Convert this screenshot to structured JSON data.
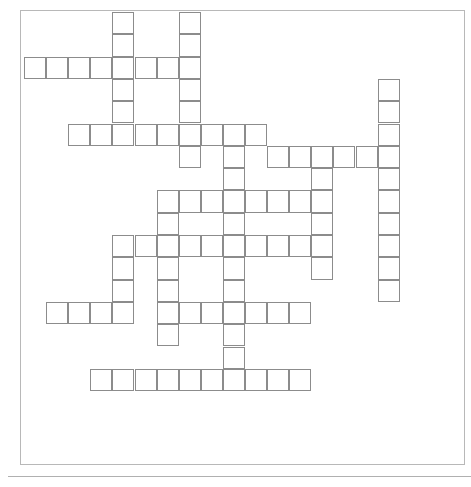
{
  "puzzle": {
    "title": "",
    "grid": {
      "origin_x": 24,
      "origin_y": 12,
      "cell_w": 22.1,
      "cell_h": 22.3,
      "line_color": "#8c8c8c",
      "words": [
        {
          "dir": "across",
          "row": 2,
          "col": 0,
          "len": 8
        },
        {
          "dir": "down",
          "row": 0,
          "col": 4,
          "len": 6
        },
        {
          "dir": "down",
          "row": 0,
          "col": 7,
          "len": 7
        },
        {
          "dir": "across",
          "row": 5,
          "col": 2,
          "len": 9
        },
        {
          "dir": "down",
          "row": 5,
          "col": 9,
          "len": 12
        },
        {
          "dir": "across",
          "row": 6,
          "col": 11,
          "len": 6
        },
        {
          "dir": "down",
          "row": 3,
          "col": 16,
          "len": 10
        },
        {
          "dir": "down",
          "row": 6,
          "col": 13,
          "len": 6
        },
        {
          "dir": "across",
          "row": 8,
          "col": 6,
          "len": 8
        },
        {
          "dir": "across",
          "row": 10,
          "col": 4,
          "len": 10
        },
        {
          "dir": "down",
          "row": 8,
          "col": 6,
          "len": 7
        },
        {
          "dir": "down",
          "row": 10,
          "col": 4,
          "len": 4
        },
        {
          "dir": "across",
          "row": 13,
          "col": 1,
          "len": 4
        },
        {
          "dir": "across",
          "row": 13,
          "col": 6,
          "len": 7
        },
        {
          "dir": "across",
          "row": 16,
          "col": 3,
          "len": 10
        }
      ]
    }
  }
}
